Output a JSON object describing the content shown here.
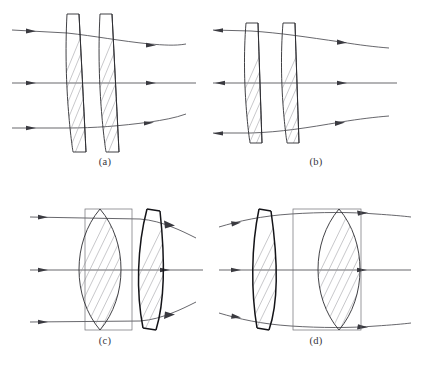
{
  "figure": {
    "background_color": "#ffffff",
    "ink_color": "#2b2b30",
    "ray_color": "#4c4c52",
    "hatch_color": "#9a9aa0",
    "panel_count": 4,
    "ray_count_per_panel": 3
  },
  "panels": [
    {
      "id": "a",
      "label": "(a)",
      "description": "Two air-spaced meniscus elements, both curving the same way; three parallel rays enter from the left and converge slightly on exit",
      "elements": [
        {
          "name": "front-meniscus-lens",
          "type": "meniscus",
          "order": 1
        },
        {
          "name": "rear-meniscus-lens",
          "type": "meniscus",
          "order": 2
        }
      ],
      "rays": [
        {
          "name": "upper-ray",
          "entry_direction": "right",
          "exit_direction": "right"
        },
        {
          "name": "axial-ray",
          "entry_direction": "right",
          "exit_direction": "right"
        },
        {
          "name": "lower-ray",
          "entry_direction": "right",
          "exit_direction": "right"
        }
      ]
    },
    {
      "id": "b",
      "label": "(b)",
      "description": "Two closely spaced meniscus elements; rays shown with arrowheads pointing outward at the left and to the right at the exit",
      "elements": [
        {
          "name": "front-meniscus-lens",
          "type": "meniscus",
          "order": 1
        },
        {
          "name": "rear-meniscus-lens",
          "type": "meniscus",
          "order": 2
        }
      ],
      "rays": [
        {
          "name": "upper-ray",
          "entry_direction": "left",
          "exit_direction": "right"
        },
        {
          "name": "axial-ray",
          "entry_direction": "right",
          "exit_direction": "right"
        },
        {
          "name": "lower-ray",
          "entry_direction": "left",
          "exit_direction": "right"
        }
      ]
    },
    {
      "id": "c",
      "label": "(c)",
      "description": "Large biconvex element inscribed in a rectangular blank followed by a thick meniscus element; parallel rays enter from the left and diverge outward after the meniscus",
      "elements": [
        {
          "name": "biconvex-lens-in-blank",
          "type": "biconvex",
          "order": 1
        },
        {
          "name": "rear-meniscus-lens",
          "type": "meniscus",
          "order": 2
        }
      ],
      "rays": [
        {
          "name": "upper-ray",
          "entry_direction": "right",
          "exit_direction": "right"
        },
        {
          "name": "axial-ray",
          "entry_direction": "right",
          "exit_direction": "right"
        },
        {
          "name": "lower-ray",
          "entry_direction": "right",
          "exit_direction": "right"
        }
      ]
    },
    {
      "id": "d",
      "label": "(d)",
      "description": "Thick meniscus element followed by a large biconvex element inscribed in a rectangular blank; rays converge through the pair and exit nearly parallel",
      "elements": [
        {
          "name": "front-meniscus-lens",
          "type": "meniscus",
          "order": 1
        },
        {
          "name": "biconvex-lens-in-blank",
          "type": "biconvex",
          "order": 2
        }
      ],
      "rays": [
        {
          "name": "upper-ray",
          "entry_direction": "right",
          "exit_direction": "right"
        },
        {
          "name": "axial-ray",
          "entry_direction": "right",
          "exit_direction": "right"
        },
        {
          "name": "lower-ray",
          "entry_direction": "right",
          "exit_direction": "right"
        }
      ]
    }
  ]
}
